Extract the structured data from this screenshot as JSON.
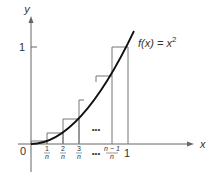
{
  "diagram": {
    "function_label": "f(x) = x²",
    "function_label_parts": {
      "lhs": "f(x) = x",
      "exp": "2"
    },
    "axes": {
      "x_label": "x",
      "y_label": "y",
      "origin_label": "0",
      "y_tick_label": "1",
      "x_end_label": "1"
    },
    "x_ticks": [
      {
        "num": "1",
        "den": "n"
      },
      {
        "num": "2",
        "den": "n"
      },
      {
        "num": "3",
        "den": "n"
      },
      {
        "num": "n − 1",
        "den": "n"
      }
    ],
    "ellipsis_axis": "•••",
    "ellipsis_plot": "•••",
    "colors": {
      "curve": "#111111",
      "rect": "#777777",
      "axis": "#666666",
      "text": "#333333"
    }
  }
}
